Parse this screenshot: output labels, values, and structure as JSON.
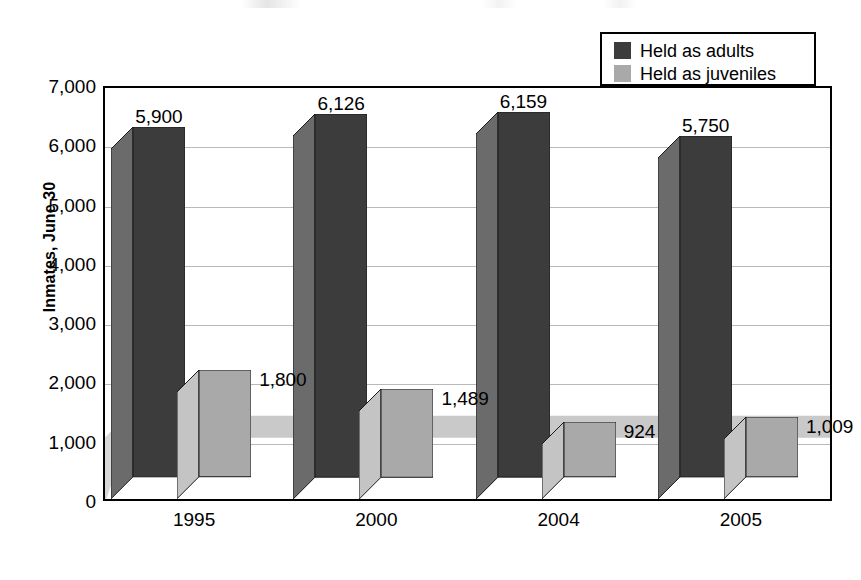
{
  "chart_data": {
    "type": "bar",
    "title": "",
    "subtitle": "",
    "xlabel": "",
    "ylabel": "Inmates, June 30",
    "categories": [
      "1995",
      "2000",
      "2004",
      "2005"
    ],
    "series": [
      {
        "name": "Held as adults",
        "values": [
          5900,
          6126,
          6159,
          5750
        ],
        "labels": [
          "5,900",
          "6,126",
          "6,159",
          "5,750"
        ],
        "color": "#3c3c3c"
      },
      {
        "name": "Held as juveniles",
        "values": [
          1800,
          1489,
          924,
          1009
        ],
        "labels": [
          "1,800",
          "1,489",
          "924",
          "1,009"
        ],
        "color": "#a9a9a9"
      }
    ],
    "ylim": [
      0,
      7000
    ],
    "ytick_values": [
      7000,
      6000,
      5000,
      4000,
      3000,
      2000,
      1000,
      0
    ],
    "ytick_labels": [
      "7,000",
      "6,000",
      "5,000",
      "4,000",
      "3,000",
      "2,000",
      "1,000",
      "0"
    ],
    "grid": true,
    "grid_axis": "y",
    "legend_position": "top-right",
    "three_d": true
  },
  "legend": {
    "items": [
      {
        "label": "Held as adults",
        "swatch": "legend-swatch-adults",
        "color": "#3c3c3c"
      },
      {
        "label": "Held as juveniles",
        "swatch": "legend-swatch-juveniles",
        "color": "#a9a9a9"
      }
    ]
  },
  "axes": {
    "y_title": "Inmates, June 30",
    "y_ticks": [
      "7,000",
      "6,000",
      "5,000",
      "4,000",
      "3,000",
      "2,000",
      "1,000",
      "0"
    ],
    "x_ticks": [
      "1995",
      "2000",
      "2004",
      "2005"
    ]
  },
  "labels": {
    "adults": [
      "5,900",
      "6,126",
      "6,159",
      "5,750"
    ],
    "juveniles": [
      "1,800",
      "1,489",
      "924",
      "1,009"
    ]
  },
  "colors": {
    "adults_front": "#3c3c3c",
    "adults_side": "#6b6b6b",
    "adults_top": "#555555",
    "juveniles_front": "#a9a9a9",
    "juveniles_side": "#c4c4c4",
    "juveniles_top": "#bdbdbd",
    "floor": "#c9c9c9",
    "grid": "#b9b9b9",
    "axis": "#000000"
  }
}
